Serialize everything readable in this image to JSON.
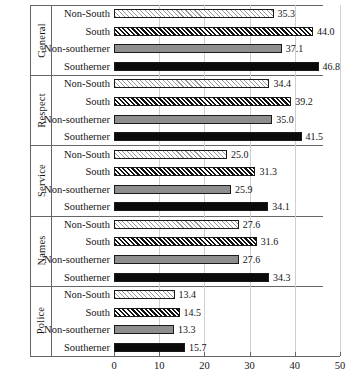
{
  "chart_data": {
    "type": "bar",
    "orientation": "horizontal",
    "title": "",
    "xlabel": "",
    "ylabel": "",
    "xlim": [
      0,
      50
    ],
    "xticks": [
      0,
      10,
      20,
      30,
      40,
      50
    ],
    "grid": true,
    "legend": "none",
    "categories": [
      "Non-South",
      "South",
      "Non-southerner",
      "Southerner"
    ],
    "panels": [
      {
        "name": "General",
        "bars": [
          {
            "label": "Non-South",
            "value": 35.3,
            "value_text": "35.3",
            "style": "light-hatch"
          },
          {
            "label": "South",
            "value": 44.0,
            "value_text": "44.0",
            "style": "dense-hatch"
          },
          {
            "label": "Non-southerner",
            "value": 37.1,
            "value_text": "37.1",
            "style": "solid-gray"
          },
          {
            "label": "Southerner",
            "value": 46.8,
            "value_text": "46.8",
            "style": "solid-black"
          }
        ]
      },
      {
        "name": "Respect",
        "bars": [
          {
            "label": "Non-South",
            "value": 34.4,
            "value_text": "34.4",
            "style": "light-hatch"
          },
          {
            "label": "South",
            "value": 39.2,
            "value_text": "39.2",
            "style": "dense-hatch"
          },
          {
            "label": "Non-southerner",
            "value": 35.0,
            "value_text": "35.0",
            "style": "solid-gray"
          },
          {
            "label": "Southerner",
            "value": 41.5,
            "value_text": "41.5",
            "style": "solid-black"
          }
        ]
      },
      {
        "name": "Service",
        "bars": [
          {
            "label": "Non-South",
            "value": 25.0,
            "value_text": "25.0",
            "style": "light-hatch"
          },
          {
            "label": "South",
            "value": 31.3,
            "value_text": "31.3",
            "style": "dense-hatch"
          },
          {
            "label": "Non-southerner",
            "value": 25.9,
            "value_text": "25.9",
            "style": "solid-gray"
          },
          {
            "label": "Southerner",
            "value": 34.1,
            "value_text": "34.1",
            "style": "solid-black"
          }
        ]
      },
      {
        "name": "Names",
        "bars": [
          {
            "label": "Non-South",
            "value": 27.6,
            "value_text": "27.6",
            "style": "light-hatch"
          },
          {
            "label": "South",
            "value": 31.6,
            "value_text": "31.6",
            "style": "dense-hatch"
          },
          {
            "label": "Non-southerner",
            "value": 27.6,
            "value_text": "27.6",
            "style": "solid-gray"
          },
          {
            "label": "Southerner",
            "value": 34.3,
            "value_text": "34.3",
            "style": "solid-black"
          }
        ]
      },
      {
        "name": "Police",
        "bars": [
          {
            "label": "Non-South",
            "value": 13.4,
            "value_text": "13.4",
            "style": "light-hatch"
          },
          {
            "label": "South",
            "value": 14.5,
            "value_text": "14.5",
            "style": "dense-hatch"
          },
          {
            "label": "Non-southerner",
            "value": 13.3,
            "value_text": "13.3",
            "style": "solid-gray"
          },
          {
            "label": "Southerner",
            "value": 15.7,
            "value_text": "15.7",
            "style": "solid-black"
          }
        ]
      }
    ],
    "colors": {
      "bar_outline": "#1a1a1a",
      "solid_gray": "#8e8e8e",
      "solid_black": "#0a0a0a",
      "gridline": "#cfcfcf",
      "frame": "#666666",
      "text": "#141414",
      "background": "#ffffff"
    }
  }
}
